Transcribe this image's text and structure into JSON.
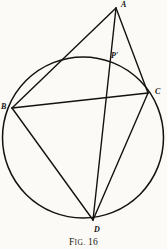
{
  "figure": {
    "caption_prefix": "F",
    "caption_smallcaps": "IG.",
    "caption_number": "16",
    "caption_full": "Fig. 16",
    "background_color": "#fbfaf7",
    "ink_color": "#141210",
    "width": 167,
    "height": 249
  },
  "circle": {
    "name": "circumscribed-circle",
    "cx": 83,
    "cy": 137.5,
    "r": 80.5,
    "stroke_width": 1.5
  },
  "points": [
    {
      "id": "A",
      "label": "A",
      "x": 116,
      "y": 8,
      "label_x": 121,
      "label_y": 1,
      "on_circle": false,
      "note": "external apex above circle"
    },
    {
      "id": "B",
      "label": "B",
      "x": 12,
      "y": 108,
      "label_x": 1,
      "label_y": 103,
      "on_circle": true,
      "note": "left vertex on circle"
    },
    {
      "id": "C",
      "label": "C",
      "x": 148,
      "y": 93,
      "label_x": 155,
      "label_y": 88,
      "on_circle": true,
      "note": "right vertex on circle"
    },
    {
      "id": "D",
      "label": "D",
      "x": 93,
      "y": 220,
      "label_x": 94,
      "label_y": 226,
      "on_circle": true,
      "note": "bottom vertex on circle"
    },
    {
      "id": "P'",
      "label": "P'",
      "x": 108,
      "y": 62,
      "label_x": 111,
      "label_y": 52,
      "on_circle": true,
      "note": "intersection of AD with circle"
    }
  ],
  "segments": [
    {
      "id": "AB",
      "from": "A",
      "to": "B",
      "x1": 116,
      "y1": 8,
      "x2": 12,
      "y2": 108,
      "stroke_width": 1.4
    },
    {
      "id": "AC",
      "from": "A",
      "to": "C",
      "x1": 116,
      "y1": 8,
      "x2": 148,
      "y2": 93,
      "stroke_width": 1.4
    },
    {
      "id": "AD",
      "from": "A",
      "to": "D",
      "x1": 116,
      "y1": 8,
      "x2": 93,
      "y2": 220,
      "stroke_width": 1.4
    },
    {
      "id": "BC",
      "from": "B",
      "to": "C",
      "x1": 12,
      "y1": 108,
      "x2": 148,
      "y2": 93,
      "stroke_width": 1.6
    },
    {
      "id": "BD",
      "from": "B",
      "to": "D",
      "x1": 12,
      "y1": 108,
      "x2": 93,
      "y2": 220,
      "stroke_width": 1.4
    },
    {
      "id": "CD",
      "from": "C",
      "to": "D",
      "x1": 148,
      "y1": 93,
      "x2": 93,
      "y2": 220,
      "stroke_width": 1.4
    }
  ]
}
